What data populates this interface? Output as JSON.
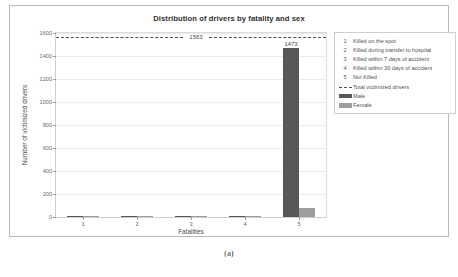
{
  "figure": {
    "caption": "(a)"
  },
  "chart_data": {
    "type": "bar",
    "title": "Distribution of drivers by fatality and sex",
    "xlabel": "Fatalities",
    "ylabel": "Number of victimized drivers",
    "categories": [
      "1",
      "2",
      "3",
      "4",
      "5"
    ],
    "series": [
      {
        "name": "Male",
        "color": "#585858",
        "values": [
          3,
          2,
          4,
          2,
          1473
        ]
      },
      {
        "name": "Female",
        "color": "#9e9e9e",
        "values": [
          1,
          1,
          2,
          1,
          75
        ]
      }
    ],
    "value_labels": {
      "male_5": "1473",
      "female_5": "75"
    },
    "ylim": [
      0,
      1600
    ],
    "yticks": [
      0,
      200,
      400,
      600,
      800,
      1000,
      1200,
      1400,
      1600
    ],
    "ytick_labels": [
      "0",
      "200",
      "400",
      "600",
      "800",
      "1000",
      "1200",
      "1400",
      "1600"
    ],
    "xticks": [
      "1",
      "2",
      "3",
      "4",
      "5"
    ],
    "grid": true,
    "reference_line": {
      "label": "1563",
      "value": 1563,
      "style": "dashed",
      "color": "#4e4e4e"
    },
    "legend_position": "right-outside",
    "legend": {
      "numbered_items": [
        {
          "key": "1",
          "label": "Killed on the spot"
        },
        {
          "key": "2",
          "label": "Killed during transfer to hospital"
        },
        {
          "key": "3",
          "label": "Killed within 7 days of accident"
        },
        {
          "key": "4",
          "label": "Killed within 30 days of accident"
        },
        {
          "key": "5",
          "label": "Not Killed"
        }
      ],
      "symbol_items": [
        {
          "symbol": "dashed-line",
          "label": "Total victimized drivers"
        },
        {
          "symbol": "swatch-male",
          "label": "Male"
        },
        {
          "symbol": "swatch-female",
          "label": "Female"
        }
      ]
    }
  }
}
